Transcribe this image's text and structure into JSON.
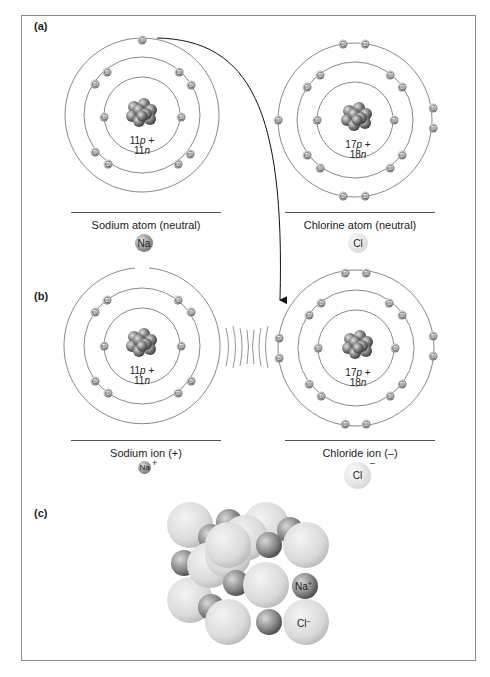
{
  "panels": {
    "a": {
      "label": "(a)",
      "sodium": {
        "title": "Sodium atom (neutral)",
        "symbol": "Na",
        "nucleus_p": "11",
        "nucleus_n": "11",
        "shells": [
          2,
          8,
          1
        ]
      },
      "chlorine": {
        "title": "Chlorine atom (neutral)",
        "symbol": "Cl",
        "nucleus_p": "17",
        "nucleus_n": "18",
        "shells": [
          2,
          8,
          7
        ]
      }
    },
    "b": {
      "label": "(b)",
      "sodium": {
        "title": "Sodium ion (+)",
        "symbol": "Na",
        "charge": "+",
        "nucleus_p": "11",
        "nucleus_n": "11",
        "shells": [
          2,
          8
        ]
      },
      "chlorine": {
        "title": "Chloride ion (–)",
        "symbol": "Cl",
        "charge": "–",
        "nucleus_p": "17",
        "nucleus_n": "18",
        "shells": [
          2,
          8,
          8
        ]
      }
    },
    "c": {
      "label": "(c)",
      "na_label": "Na",
      "na_charge": "+",
      "cl_label": "Cl",
      "cl_charge": "–"
    }
  },
  "text": {
    "p_suffix": "p +",
    "n_suffix": "n"
  },
  "colors": {
    "na_sphere": "#8a8a8a",
    "cl_sphere": "#dcdcdc",
    "orbit": "#6a6a6a",
    "frame": "#8a8a8a"
  }
}
